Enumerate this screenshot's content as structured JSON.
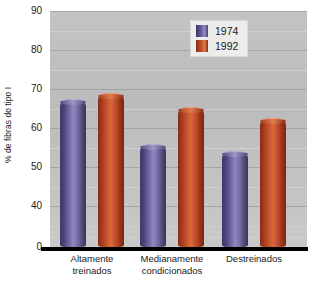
{
  "chart_data": {
    "type": "bar",
    "title": "",
    "xlabel": "",
    "ylabel": "% de fibras do tipo I",
    "categories": [
      "Altamente treinados",
      "Medianamente condicionados",
      "Destreinados"
    ],
    "category_lines": [
      [
        "Altamente",
        "treinados"
      ],
      [
        "Medianamente",
        "condicionados"
      ],
      [
        "Destreinados",
        ""
      ]
    ],
    "series": [
      {
        "name": "1974",
        "color": "#5b5190",
        "values": [
          67.5,
          56,
          54
        ]
      },
      {
        "name": "1992",
        "color": "#b94a26",
        "values": [
          69,
          65.5,
          62.5
        ]
      }
    ],
    "ylim": [
      0,
      90
    ],
    "axis_break": true,
    "axis_break_note": "axis compressed between 0 and 40",
    "yticks": [
      0,
      40,
      50,
      60,
      70,
      80,
      90
    ],
    "ytick_labels": [
      "0",
      "40",
      "50",
      "60",
      "70",
      "80",
      "90"
    ],
    "grid": true,
    "legend_position": "top-right-inside"
  },
  "legend": {
    "entries": [
      {
        "label": "1974"
      },
      {
        "label": "1992"
      }
    ]
  },
  "axis": {
    "y_title": "% de fibras do tipo I",
    "ticks": [
      "90",
      "80",
      "70",
      "60",
      "50",
      "40",
      "0"
    ]
  },
  "colors": {
    "series_1974": "#5b5190",
    "series_1992": "#b94a26",
    "plot_background": "#c0c0c0",
    "axis_line": "#000000",
    "text": "#1b1b1b"
  }
}
